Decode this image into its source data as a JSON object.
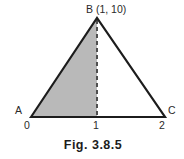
{
  "figure": {
    "caption": "Fig. 3.8.5",
    "vertex_labels": {
      "a": "A",
      "b": "B (1, 10)",
      "c": "C"
    },
    "axis_ticks": [
      "0",
      "1",
      "2"
    ],
    "colors": {
      "shade": "#b9b9b9",
      "outline": "#1c1c1c",
      "dash": "#4f4f4f",
      "background": "#ffffff"
    }
  }
}
